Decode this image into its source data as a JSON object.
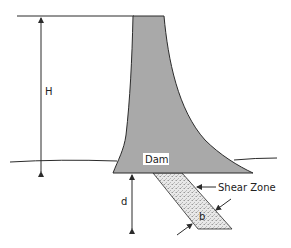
{
  "diagram": {
    "labels": {
      "height": "H",
      "dam": "Dam",
      "depth": "d",
      "shear_zone": "Shear Zone",
      "width": "b"
    },
    "colors": {
      "dam_fill": "#a9a9a9",
      "shear_zone_fill": "#e6e6e6",
      "line": "#2b2b2b",
      "background": "#ffffff"
    }
  }
}
